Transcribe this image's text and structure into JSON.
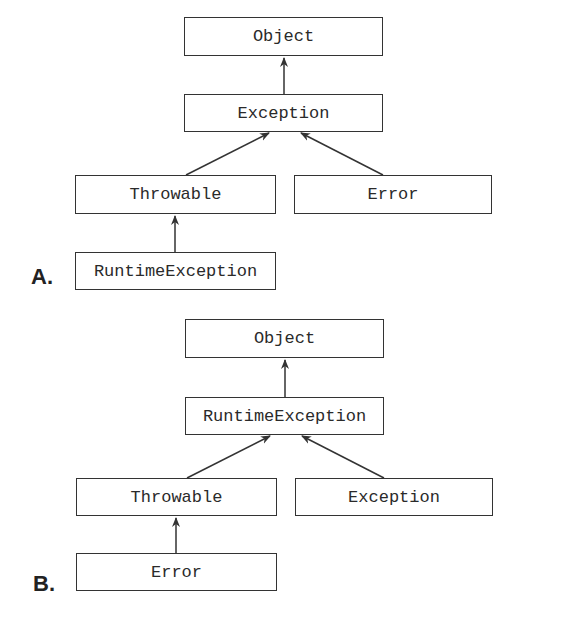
{
  "option_a": {
    "label": "A.",
    "nodes": {
      "top": "Object",
      "middle": "Exception",
      "left": "Throwable",
      "right": "Error",
      "bottom": "RuntimeException"
    },
    "edges": [
      [
        "Exception",
        "Object"
      ],
      [
        "Throwable",
        "Exception"
      ],
      [
        "Error",
        "Exception"
      ],
      [
        "RuntimeException",
        "Throwable"
      ]
    ]
  },
  "option_b": {
    "label": "B.",
    "nodes": {
      "top": "Object",
      "middle": "RuntimeException",
      "left": "Throwable",
      "right": "Exception",
      "bottom": "Error"
    },
    "edges": [
      [
        "RuntimeException",
        "Object"
      ],
      [
        "Throwable",
        "RuntimeException"
      ],
      [
        "Exception",
        "RuntimeException"
      ],
      [
        "Error",
        "Throwable"
      ]
    ]
  }
}
